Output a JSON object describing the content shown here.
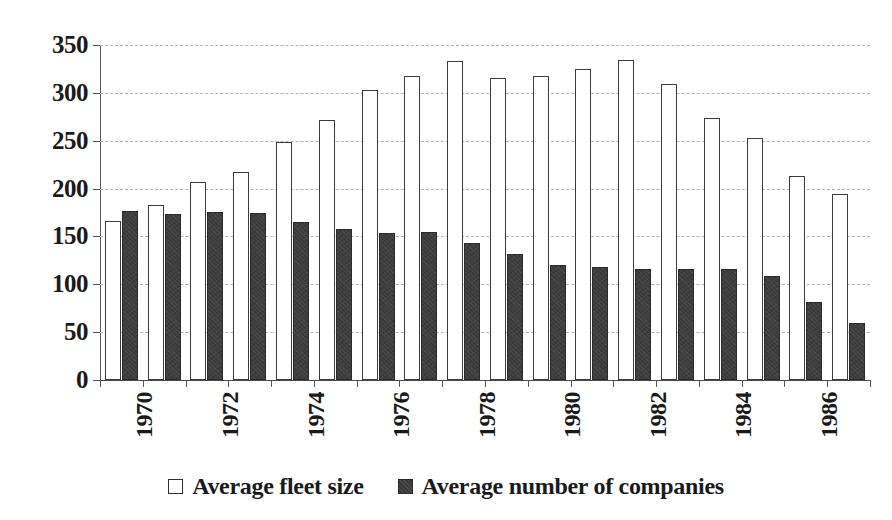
{
  "chart_data": {
    "type": "bar",
    "title": "",
    "subtitle": "",
    "xlabel": "",
    "ylabel": "",
    "ylim": [
      0,
      350
    ],
    "ytick_labels": [
      "0",
      "50",
      "100",
      "150",
      "200",
      "250",
      "300",
      "350"
    ],
    "ytick_values": [
      0,
      50,
      100,
      150,
      200,
      250,
      300,
      350
    ],
    "grid": true,
    "grid_style": "dashed-horizontal",
    "legend_position": "bottom-center",
    "categories": [
      "1970",
      "1971",
      "1972",
      "1973",
      "1974",
      "1975",
      "1976",
      "1977",
      "1978",
      "1979",
      "1980",
      "1981",
      "1982",
      "1983",
      "1984",
      "1985",
      "1986",
      "1987"
    ],
    "xtick_labels_shown": [
      "1970",
      "",
      "1972",
      "",
      "1974",
      "",
      "1976",
      "",
      "1978",
      "",
      "1980",
      "",
      "1982",
      "",
      "1984",
      "",
      "1986",
      ""
    ],
    "xtick_label_rotation": -90,
    "series": [
      {
        "name": "Average fleet size",
        "color": "#ffffff",
        "edge_color": "#3b3b3b",
        "legend_marker": "open-square",
        "values": [
          166,
          183,
          207,
          217,
          249,
          272,
          303,
          318,
          333,
          316,
          318,
          325,
          334,
          309,
          274,
          253,
          213,
          194
        ]
      },
      {
        "name": "Average number of companies",
        "color": "#3a3a3a",
        "edge_color": "#2a2a2a",
        "legend_marker": "filled-square",
        "values": [
          177,
          173,
          176,
          174,
          165,
          158,
          154,
          155,
          143,
          132,
          120,
          118,
          116,
          116,
          116,
          109,
          81,
          60
        ]
      }
    ]
  },
  "legend": {
    "items": [
      {
        "label": "Average fleet size",
        "marker": "open-square"
      },
      {
        "label": "Average number of companies",
        "marker": "filled-square"
      }
    ]
  }
}
